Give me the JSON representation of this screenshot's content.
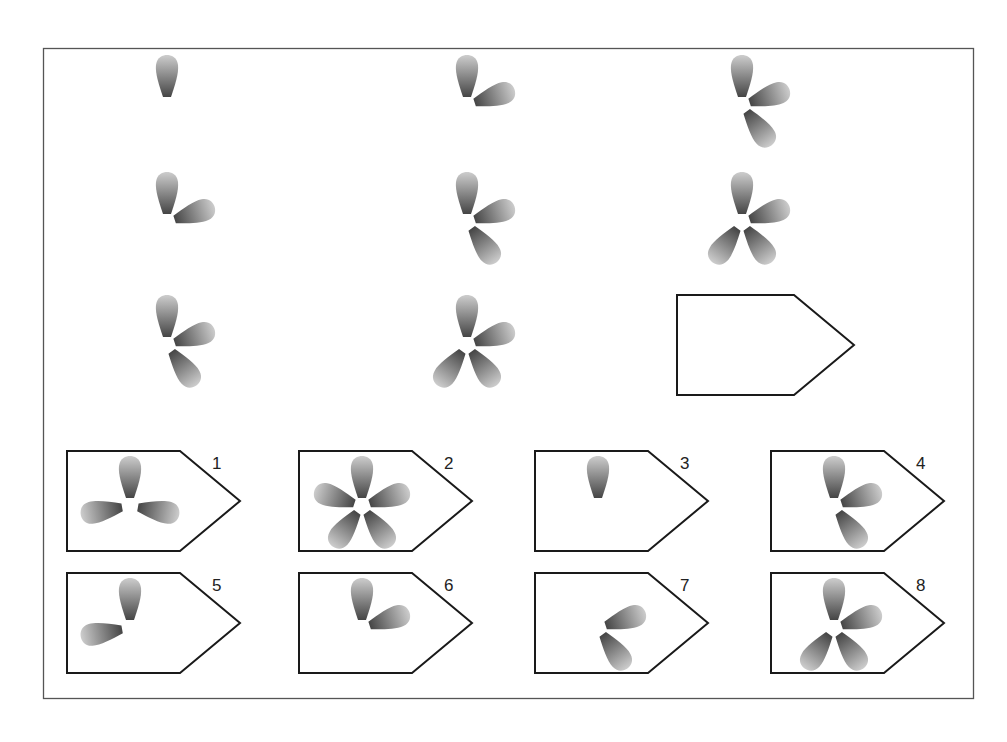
{
  "puzzle": {
    "type": "matrix-reasoning",
    "frame": {
      "x": 43,
      "y": 48,
      "width": 930,
      "height": 650
    },
    "petal_angles_deg": [
      0,
      72,
      144,
      216,
      288
    ],
    "colors": {
      "petal_dark": "#4a4a4a",
      "petal_light": "#c8c8c8",
      "stroke": "#1a1a1a",
      "frame": "#555555"
    },
    "grid": [
      {
        "row": 1,
        "col": 1,
        "cx": 167,
        "cy": 105,
        "petals": [
          0
        ]
      },
      {
        "row": 1,
        "col": 2,
        "cx": 467,
        "cy": 105,
        "petals": [
          0,
          72
        ]
      },
      {
        "row": 1,
        "col": 3,
        "cx": 742,
        "cy": 105,
        "petals": [
          0,
          72,
          144
        ]
      },
      {
        "row": 2,
        "col": 1,
        "cx": 167,
        "cy": 222,
        "petals": [
          0,
          72
        ]
      },
      {
        "row": 2,
        "col": 2,
        "cx": 467,
        "cy": 222,
        "petals": [
          0,
          72,
          144
        ]
      },
      {
        "row": 2,
        "col": 3,
        "cx": 742,
        "cy": 222,
        "petals": [
          0,
          72,
          144,
          216
        ]
      },
      {
        "row": 3,
        "col": 1,
        "cx": 167,
        "cy": 345,
        "petals": [
          0,
          72,
          144
        ]
      },
      {
        "row": 3,
        "col": 2,
        "cx": 467,
        "cy": 345,
        "petals": [
          0,
          72,
          144,
          216
        ]
      },
      {
        "row": 3,
        "col": 3,
        "missing": true,
        "box": {
          "x": 677,
          "y": 295,
          "w": 177,
          "h": 100
        }
      }
    ],
    "options": [
      {
        "label": "1",
        "x": 67,
        "y": 451,
        "petals": [
          0,
          100,
          260
        ]
      },
      {
        "label": "2",
        "x": 299,
        "y": 451,
        "petals": [
          0,
          72,
          144,
          216,
          288
        ]
      },
      {
        "label": "3",
        "x": 535,
        "y": 451,
        "petals": [
          0
        ]
      },
      {
        "label": "4",
        "x": 771,
        "y": 451,
        "petals": [
          0,
          72,
          144
        ]
      },
      {
        "label": "5",
        "x": 67,
        "y": 573,
        "petals": [
          0,
          260
        ]
      },
      {
        "label": "6",
        "x": 299,
        "y": 573,
        "petals": [
          0,
          72
        ]
      },
      {
        "label": "7",
        "x": 535,
        "y": 573,
        "petals": [
          72,
          144
        ]
      },
      {
        "label": "8",
        "x": 771,
        "y": 573,
        "petals": [
          0,
          72,
          144,
          216
        ]
      }
    ]
  }
}
